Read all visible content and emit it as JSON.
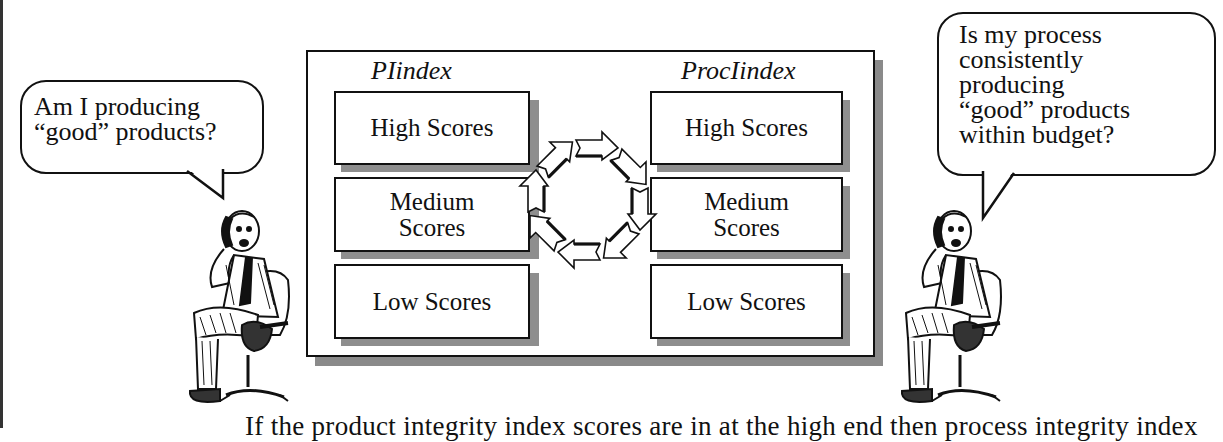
{
  "left_bubble": {
    "lines": [
      "Am I producing",
      "“good” products?"
    ]
  },
  "right_bubble": {
    "lines": [
      "Is my process",
      "consistently",
      "producing",
      "“good” products",
      "within budget?"
    ]
  },
  "diagram": {
    "left_column": {
      "title": "PIindex",
      "boxes": [
        {
          "lines": [
            "High Scores"
          ]
        },
        {
          "lines": [
            "Medium",
            "Scores"
          ]
        },
        {
          "lines": [
            "Low Scores"
          ]
        }
      ]
    },
    "right_column": {
      "title": "ProcIindex",
      "boxes": [
        {
          "lines": [
            "High Scores"
          ]
        },
        {
          "lines": [
            "Medium",
            "Scores"
          ]
        },
        {
          "lines": [
            "Low Scores"
          ]
        }
      ]
    },
    "center_icon": "cycle-arrows-icon",
    "shadow_color": "#8a8a8a",
    "border_color": "#111111"
  },
  "figures": {
    "left": "businessman-on-phone-icon",
    "right": "businessman-on-phone-icon"
  },
  "caption": {
    "text": "If the product integrity index scores are in at the high end then process integrity index"
  }
}
